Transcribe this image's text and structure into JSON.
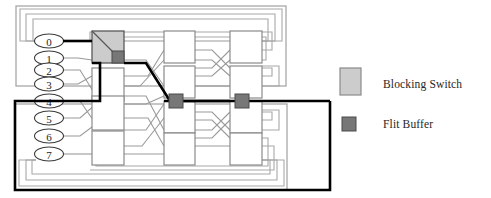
{
  "figure": {
    "kind": "multistage-interconnection-network",
    "title": "",
    "node_count": 8,
    "stage_count": 3,
    "switches_per_stage": 4,
    "node_labels": [
      "0",
      "1",
      "2",
      "3",
      "4",
      "5",
      "6",
      "7"
    ],
    "colors": {
      "blocking_switch_fill": "#cccccc",
      "blocking_switch_stroke": "#5a5a5a",
      "flit_buffer_fill": "#777777",
      "flit_buffer_stroke": "#4a4a4a",
      "switch_fill": "#ffffff",
      "switch_stroke": "#8a8a8a",
      "wire": "#9a9a9a",
      "highlight_path": "#000000",
      "loopback": "#a8a8a8",
      "text": "#262626"
    },
    "highlight_path": {
      "description": "blocked request route",
      "source_node": "0",
      "destination_node": "4",
      "stroke_width": 2.6
    }
  },
  "legend": {
    "items": [
      {
        "swatch": "blocking-switch-swatch",
        "label": "Blocking Switch",
        "fill": "#cccccc"
      },
      {
        "swatch": "flit-buffer-swatch",
        "label": "Flit Buffer",
        "fill": "#777777"
      }
    ]
  },
  "elements": {
    "blocking_switch": {
      "name": "blocking-switch",
      "stage": 1,
      "row": 0
    },
    "flit_buffers": [
      {
        "name": "flit-buffer-stage2",
        "stage": 2,
        "row": 4
      },
      {
        "name": "flit-buffer-stage3",
        "stage": 3,
        "row": 4
      }
    ]
  }
}
